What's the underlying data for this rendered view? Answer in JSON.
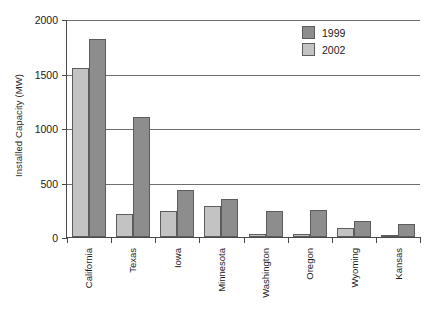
{
  "chart_data": {
    "type": "bar",
    "title": "",
    "xlabel": "",
    "ylabel": "Installed Capacity (MW)",
    "ylim": [
      0,
      2000
    ],
    "yticks": [
      0,
      500,
      1000,
      1500,
      2000
    ],
    "ytick_labels": [
      "0",
      "500",
      "1000",
      "1500",
      "2000"
    ],
    "grid": true,
    "legend_position": "top-right",
    "categories": [
      "California",
      "Texas",
      "Iowa",
      "Minnesota",
      "Washington",
      "Oregon",
      "Wyoming",
      "Kansas"
    ],
    "series": [
      {
        "name": "2002",
        "color": "#c3c3c3",
        "values": [
          1555,
          210,
          240,
          285,
          25,
          25,
          85,
          15
        ]
      },
      {
        "name": "1999",
        "color": "#8d8d8d",
        "values": [
          1820,
          1100,
          430,
          350,
          240,
          245,
          150,
          115
        ]
      }
    ]
  },
  "legend": {
    "entries": [
      {
        "label": "1999",
        "swatch": "s1999"
      },
      {
        "label": "2002",
        "swatch": "s2002"
      }
    ]
  },
  "colors": {
    "series_1999": "#8d8d8d",
    "series_2002": "#c3c3c3",
    "axis": "#4a4a4a",
    "gridline": "#6f6f6f",
    "background": "#ffffff"
  }
}
